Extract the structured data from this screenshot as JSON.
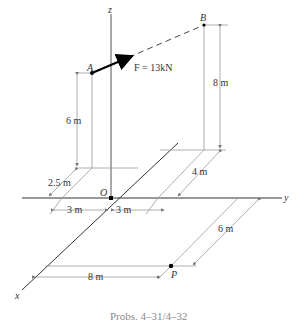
{
  "figure": {
    "caption": "Probs. 4–31/4–32",
    "axes": {
      "x": "x",
      "y": "y",
      "z": "z"
    },
    "points": {
      "A": "A",
      "B": "B",
      "O": "O",
      "P": "P"
    },
    "force": {
      "label": "F = 13kN",
      "magnitude": "13",
      "unit": "kN"
    },
    "dimensions": {
      "A_height": "6 m",
      "B_height": "8 m",
      "A_x_offset": "2.5 m",
      "A_y_offset": "3 m",
      "B_y_offset": "3 m",
      "B_x_offset": "4 m",
      "P_x_offset": "6 m",
      "P_y_offset": "8 m"
    },
    "colors": {
      "axis": "#333333",
      "construction": "#9a9a9a",
      "caption": "#8a8a8a",
      "force": "#000000"
    }
  }
}
